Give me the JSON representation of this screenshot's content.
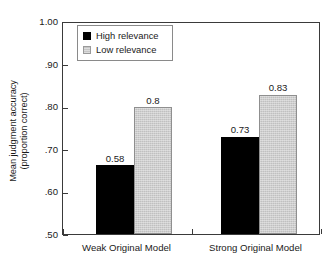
{
  "chart_data": {
    "type": "bar",
    "title": "",
    "xlabel": "",
    "ylabel_line1": "Mean judgment accuracy",
    "ylabel_line2": "(proportion correct)",
    "categories": [
      "Weak Original Model",
      "Strong Original Model"
    ],
    "series": [
      {
        "name": "High relevance",
        "color": "#000000",
        "values": [
          0.58,
          0.73
        ],
        "labels": [
          "0.58",
          "0.73"
        ]
      },
      {
        "name": "Low relevance",
        "color": "#c0c0c0",
        "values": [
          0.8,
          0.83
        ],
        "labels": [
          "0.8",
          "0.83"
        ]
      }
    ],
    "ylim": [
      0.5,
      1.0
    ],
    "yticks": [
      1.0,
      0.9,
      0.8,
      0.7,
      0.6,
      0.5
    ],
    "ytick_labels": [
      "1.00",
      ".90",
      ".80",
      ".70",
      ".60",
      ".50"
    ],
    "grid": false,
    "legend_position": "upper-left-inside",
    "frame_color": "#3a3a3a",
    "background": "#ffffff"
  },
  "legend": {
    "items": [
      {
        "label": "High relevance",
        "swatch": "high"
      },
      {
        "label": "Low relevance",
        "swatch": "low"
      }
    ]
  }
}
